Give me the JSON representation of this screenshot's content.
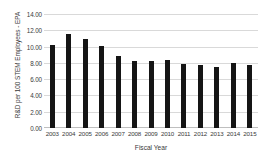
{
  "chart_data": {
    "type": "bar",
    "title": "",
    "xlabel": "Fiscal Year",
    "ylabel": "R&D per 100 STEM Employees - EPA",
    "categories": [
      "2003",
      "2004",
      "2005",
      "2006",
      "2007",
      "2008",
      "2009",
      "2010",
      "2011",
      "2012",
      "2013",
      "2014",
      "2015"
    ],
    "values": [
      10.2,
      11.5,
      10.9,
      10.1,
      8.8,
      8.2,
      8.2,
      8.3,
      7.9,
      7.8,
      7.5,
      8.0,
      7.7
    ],
    "ylim": [
      0,
      14
    ],
    "ytick_labels": [
      "14.00",
      "12.00",
      "10.00",
      "8.00",
      "6.00",
      "4.00",
      "2.00",
      "0.00"
    ],
    "ytick_values": [
      14,
      12,
      10,
      8,
      6,
      4,
      2,
      0
    ],
    "grid": true,
    "legend": false,
    "bar_color": "#151515",
    "grid_color": "#d9d9d9",
    "text_color": "#3a3a3a",
    "background": "#ffffff"
  }
}
